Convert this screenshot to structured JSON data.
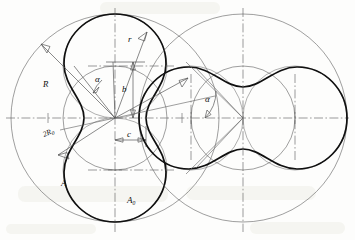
{
  "figure": {
    "type": "engineering-geometry-diagram",
    "background": "#fdfdfc",
    "line_colors": {
      "profile": "#101010",
      "construction": "#6b6b6b",
      "centerline": "#595959",
      "dimension": "#4a4a4a"
    }
  },
  "labels": {
    "radius_R": "R",
    "radius_r": "r",
    "eccentricity_b": "b",
    "angle_alpha_left": "α",
    "angle_alpha_right": "α",
    "diameter_2R0": "2R",
    "diameter_2R0_sub": "0",
    "area_A": "A",
    "area_A0": "A",
    "area_A0_sub": "0",
    "dim_c": "c"
  },
  "geometry": {
    "left_center": {
      "x": 115,
      "y": 118
    },
    "right_center": {
      "x": 243,
      "y": 118
    },
    "outer_radius": 104,
    "generating_radius": 52,
    "rotor_lobes": 2,
    "left_orientation": "vertical",
    "right_orientation": "horizontal"
  }
}
